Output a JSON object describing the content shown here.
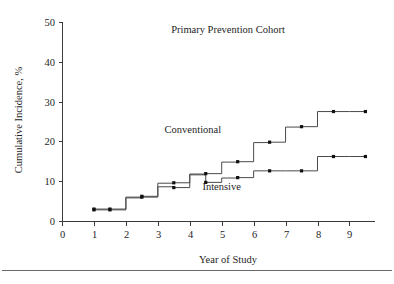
{
  "chart_data": {
    "type": "line",
    "title": "Primary Prevention Cohort",
    "xlabel": "Year of Study",
    "ylabel": "Cumulative Incidence, %",
    "xlim": [
      0,
      9.8
    ],
    "ylim": [
      0,
      50
    ],
    "xticks": [
      0,
      1,
      2,
      3,
      4,
      5,
      6,
      7,
      8,
      9
    ],
    "xticklabels": [
      "0",
      "1",
      "2",
      "3",
      "4",
      "5",
      "6",
      "7",
      "8",
      "9"
    ],
    "yticks": [
      0,
      10,
      20,
      30,
      40,
      50
    ],
    "yticklabels": [
      "0",
      "10",
      "20",
      "30",
      "40",
      "50"
    ],
    "grid": false,
    "legend_position": "inline-annotation",
    "annotations": [
      {
        "text": "Conventional",
        "x": 4.1,
        "y": 22.1
      },
      {
        "text": "Intensive",
        "x": 5.0,
        "y": 7.8
      }
    ],
    "series": [
      {
        "name": "Conventional",
        "x": [
          1.0,
          1.5,
          2.0,
          2.5,
          3.0,
          3.5,
          4.0,
          4.5,
          5.0,
          5.5,
          6.0,
          6.5,
          7.0,
          7.5,
          8.0,
          8.5,
          9.0,
          9.5
        ],
        "values": [
          3.0,
          3.0,
          6.0,
          6.2,
          9.5,
          9.6,
          11.8,
          11.9,
          14.8,
          14.9,
          19.7,
          19.8,
          23.6,
          23.7,
          27.5,
          27.5,
          27.5,
          27.5
        ],
        "marker_x": [
          1.0,
          1.5,
          2.5,
          3.5,
          4.5,
          5.5,
          6.5,
          7.5,
          8.5,
          9.5
        ],
        "marker_y": [
          3.0,
          3.0,
          6.2,
          9.6,
          11.9,
          14.9,
          19.8,
          23.7,
          27.5,
          27.5
        ]
      },
      {
        "name": "Intensive",
        "x": [
          1.0,
          1.5,
          2.0,
          2.5,
          3.0,
          3.5,
          4.0,
          4.5,
          5.0,
          5.5,
          6.0,
          6.5,
          7.0,
          7.5,
          8.0,
          8.5,
          9.0,
          9.5
        ],
        "values": [
          2.8,
          2.8,
          5.8,
          6.0,
          8.6,
          8.4,
          11.6,
          9.7,
          10.8,
          10.9,
          12.6,
          12.6,
          12.6,
          12.6,
          16.2,
          16.2,
          16.2,
          16.2
        ],
        "marker_x": [
          1.0,
          1.5,
          2.5,
          3.5,
          4.5,
          5.5,
          6.5,
          7.5,
          8.5,
          9.5
        ],
        "marker_y": [
          2.8,
          2.8,
          6.0,
          8.4,
          9.7,
          10.9,
          12.6,
          12.6,
          16.2,
          16.2
        ]
      }
    ],
    "colors": {
      "line": "#4a4a4a",
      "marker": "#111111",
      "axis": "#3b3b3b",
      "text": "#1e1e1e",
      "background": "#ffffff"
    }
  }
}
